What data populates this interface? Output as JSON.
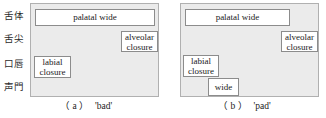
{
  "figure": {
    "row_labels": [
      {
        "name": "tongue-body",
        "text": "舌体"
      },
      {
        "name": "tongue-tip",
        "text": "舌尖"
      },
      {
        "name": "lips",
        "text": "口唇"
      },
      {
        "name": "glottis",
        "text": "声門"
      }
    ],
    "colors": {
      "panel_background": "#ebebeb",
      "panel_border": "#b0b0b0",
      "gesture_fill": "#ffffff",
      "gesture_border": "#8c8c8c",
      "text": "#1a1a1a"
    },
    "panels": [
      {
        "id": "a",
        "caption_tag": "（ a ）",
        "caption_word": "'bad'",
        "gestures": [
          {
            "name": "palatal-wide",
            "label": "palatal wide",
            "tier": "tongue-body"
          },
          {
            "name": "alveolar-closure",
            "label": "alveolar\nclosure",
            "tier": "tongue-tip"
          },
          {
            "name": "labial-closure",
            "label": "labial\nclosure",
            "tier": "lips"
          }
        ]
      },
      {
        "id": "b",
        "caption_tag": "（ b ）",
        "caption_word": "'pad'",
        "gestures": [
          {
            "name": "palatal-wide",
            "label": "palatal wide",
            "tier": "tongue-body"
          },
          {
            "name": "alveolar-closure",
            "label": "alveolar\nclosure",
            "tier": "tongue-tip"
          },
          {
            "name": "labial-closure",
            "label": "labial\nclosure",
            "tier": "lips"
          },
          {
            "name": "glottal-wide",
            "label": "wide",
            "tier": "glottis"
          }
        ]
      }
    ]
  }
}
